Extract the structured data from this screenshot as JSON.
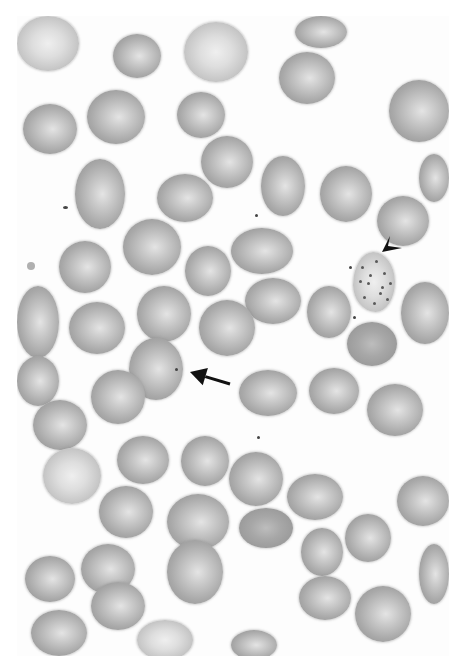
{
  "image": {
    "description": "Grayscale light micrograph of a peripheral blood smear showing red blood cells",
    "annotations": [
      {
        "type": "arrow",
        "label": "arrow-pointing-to-cell-with-small-dot-inclusion"
      },
      {
        "type": "arrowhead",
        "label": "arrowhead-pointing-to-stippled-cell"
      }
    ]
  },
  "colors": {
    "background": "#ffffff",
    "cell_rim": "#8e8e8e",
    "cell_center": "#e4e4e4",
    "annotation": "#111111"
  },
  "cells": [
    {
      "x": 0,
      "y": 0,
      "w": 62,
      "h": 55,
      "kind": "pale"
    },
    {
      "x": 96,
      "y": 18,
      "w": 48,
      "h": 44
    },
    {
      "x": 167,
      "y": 6,
      "w": 64,
      "h": 60,
      "kind": "pale"
    },
    {
      "x": 278,
      "y": 0,
      "w": 52,
      "h": 32
    },
    {
      "x": 262,
      "y": 36,
      "w": 56,
      "h": 52
    },
    {
      "x": 6,
      "y": 88,
      "w": 54,
      "h": 50
    },
    {
      "x": 70,
      "y": 74,
      "w": 58,
      "h": 54
    },
    {
      "x": 160,
      "y": 76,
      "w": 48,
      "h": 46
    },
    {
      "x": 372,
      "y": 64,
      "w": 60,
      "h": 62
    },
    {
      "x": 184,
      "y": 120,
      "w": 52,
      "h": 52
    },
    {
      "x": 58,
      "y": 143,
      "w": 50,
      "h": 70
    },
    {
      "x": 140,
      "y": 158,
      "w": 56,
      "h": 48
    },
    {
      "x": 244,
      "y": 140,
      "w": 44,
      "h": 60
    },
    {
      "x": 303,
      "y": 150,
      "w": 52,
      "h": 56
    },
    {
      "x": 402,
      "y": 138,
      "w": 30,
      "h": 48
    },
    {
      "x": 106,
      "y": 203,
      "w": 58,
      "h": 56
    },
    {
      "x": 360,
      "y": 180,
      "w": 52,
      "h": 50
    },
    {
      "x": 42,
      "y": 225,
      "w": 52,
      "h": 52
    },
    {
      "x": 168,
      "y": 230,
      "w": 46,
      "h": 50
    },
    {
      "x": 214,
      "y": 212,
      "w": 62,
      "h": 46
    },
    {
      "x": 0,
      "y": 270,
      "w": 42,
      "h": 72
    },
    {
      "x": 120,
      "y": 270,
      "w": 54,
      "h": 56
    },
    {
      "x": 228,
      "y": 262,
      "w": 56,
      "h": 46
    },
    {
      "x": 290,
      "y": 270,
      "w": 44,
      "h": 52
    },
    {
      "x": 384,
      "y": 266,
      "w": 48,
      "h": 62
    },
    {
      "x": 52,
      "y": 286,
      "w": 56,
      "h": 52
    },
    {
      "x": 182,
      "y": 284,
      "w": 56,
      "h": 56
    },
    {
      "x": 330,
      "y": 306,
      "w": 50,
      "h": 44,
      "kind": "dark"
    },
    {
      "x": 0,
      "y": 340,
      "w": 42,
      "h": 50
    },
    {
      "x": 112,
      "y": 322,
      "w": 54,
      "h": 62
    },
    {
      "x": 74,
      "y": 354,
      "w": 54,
      "h": 54
    },
    {
      "x": 222,
      "y": 354,
      "w": 58,
      "h": 46
    },
    {
      "x": 292,
      "y": 352,
      "w": 50,
      "h": 46
    },
    {
      "x": 350,
      "y": 368,
      "w": 56,
      "h": 52
    },
    {
      "x": 16,
      "y": 384,
      "w": 54,
      "h": 50
    },
    {
      "x": 26,
      "y": 432,
      "w": 58,
      "h": 56,
      "kind": "pale"
    },
    {
      "x": 100,
      "y": 420,
      "w": 52,
      "h": 48
    },
    {
      "x": 164,
      "y": 420,
      "w": 48,
      "h": 50
    },
    {
      "x": 212,
      "y": 436,
      "w": 54,
      "h": 54
    },
    {
      "x": 270,
      "y": 458,
      "w": 56,
      "h": 46
    },
    {
      "x": 380,
      "y": 460,
      "w": 52,
      "h": 50
    },
    {
      "x": 82,
      "y": 470,
      "w": 54,
      "h": 52
    },
    {
      "x": 150,
      "y": 478,
      "w": 62,
      "h": 56
    },
    {
      "x": 222,
      "y": 492,
      "w": 54,
      "h": 40,
      "kind": "dark"
    },
    {
      "x": 284,
      "y": 512,
      "w": 42,
      "h": 48
    },
    {
      "x": 328,
      "y": 498,
      "w": 46,
      "h": 48
    },
    {
      "x": 402,
      "y": 528,
      "w": 30,
      "h": 60
    },
    {
      "x": 8,
      "y": 540,
      "w": 50,
      "h": 46
    },
    {
      "x": 64,
      "y": 528,
      "w": 54,
      "h": 50
    },
    {
      "x": 74,
      "y": 566,
      "w": 54,
      "h": 48
    },
    {
      "x": 150,
      "y": 524,
      "w": 56,
      "h": 64
    },
    {
      "x": 282,
      "y": 560,
      "w": 52,
      "h": 44
    },
    {
      "x": 338,
      "y": 570,
      "w": 56,
      "h": 56
    },
    {
      "x": 14,
      "y": 594,
      "w": 56,
      "h": 46
    },
    {
      "x": 120,
      "y": 604,
      "w": 56,
      "h": 40,
      "kind": "pale"
    },
    {
      "x": 214,
      "y": 614,
      "w": 46,
      "h": 30
    }
  ],
  "stippled_cell": {
    "x": 336,
    "y": 236,
    "w": 42,
    "h": 60
  },
  "arrow": {
    "x1": 230,
    "y1": 384,
    "x2": 190,
    "y2": 372
  },
  "arrowhead": {
    "tip_x": 382,
    "tip_y": 252
  }
}
